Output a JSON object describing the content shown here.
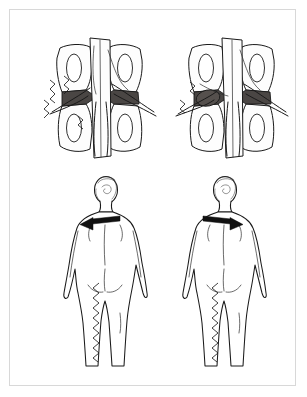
{
  "document": {
    "title": "Lumbar nerve root compression — comparative illustration",
    "medium": "ink line drawing",
    "background_color": "#ffffff",
    "frame_color": "#d8d8d8",
    "ink_color": "#1a1a1a"
  },
  "figures": [
    {
      "id": "spine-left",
      "position": "top-left",
      "view": "posterior vertebral segment, cutaway",
      "label": "",
      "features": [
        "stippled vertebral bodies",
        "four oval intervertebral foramina",
        "dark intervertebral disc band",
        "emerging spinal nerve roots",
        "zigzag pain radiation marks on left side"
      ],
      "pain_marks": {
        "present": true,
        "side": "left",
        "count": 3
      },
      "nodule": {
        "present": false
      }
    },
    {
      "id": "spine-right",
      "position": "top-right",
      "view": "posterior vertebral segment, cutaway",
      "label": "",
      "features": [
        "stippled vertebral bodies",
        "four oval intervertebral foramina",
        "dark intervertebral disc band",
        "dark oval herniated fragment compressing left nerve root",
        "emerging spinal nerve roots"
      ],
      "pain_marks": {
        "present": true,
        "side": "left",
        "count": 2
      },
      "nodule": {
        "present": true,
        "side": "left",
        "color": "#55504d"
      }
    },
    {
      "id": "body-left",
      "position": "bottom-left",
      "view": "posterior full-body figure",
      "label": "",
      "arrow": {
        "direction": "left",
        "location": "upper back",
        "color": "#111111"
      },
      "pain_path": {
        "present": true,
        "side": "left",
        "from": "buttock",
        "to": "lower leg",
        "style": "zigzag"
      }
    },
    {
      "id": "body-right",
      "position": "bottom-right",
      "view": "posterior full-body figure",
      "label": "",
      "arrow": {
        "direction": "right",
        "location": "upper back",
        "color": "#111111"
      },
      "pain_path": {
        "present": true,
        "side": "left",
        "from": "buttock",
        "to": "lower leg",
        "style": "zigzag"
      }
    }
  ]
}
